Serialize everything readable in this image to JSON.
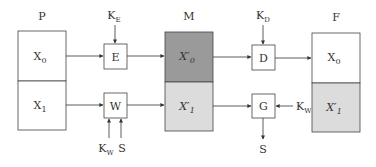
{
  "colors": {
    "stroke": "#444444",
    "m_top": "#9a9a9a",
    "m_bottom": "#dcdcdc",
    "f_bottom": "#dcdcdc",
    "white": "#ffffff"
  },
  "blocks": {
    "P": {
      "title": "P",
      "top": "X",
      "top_sub": "0",
      "bottom": "X",
      "bottom_sub": "1"
    },
    "M": {
      "title": "M",
      "top": "X′",
      "top_sub": "0",
      "bottom": "X′",
      "bottom_sub": "1"
    },
    "F": {
      "title": "F",
      "top": "X",
      "top_sub": "0",
      "bottom": "X′",
      "bottom_sub": "1"
    }
  },
  "operators": {
    "E": {
      "label": "E",
      "key": "K",
      "key_sub": "E"
    },
    "W": {
      "label": "W",
      "inputs": [
        {
          "text": "K",
          "sub": "W"
        },
        {
          "text": "S",
          "sub": ""
        }
      ]
    },
    "D": {
      "label": "D",
      "key": "K",
      "key_sub": "D"
    },
    "G": {
      "label": "G",
      "key": "K",
      "key_sub": "W",
      "output": "S"
    }
  }
}
